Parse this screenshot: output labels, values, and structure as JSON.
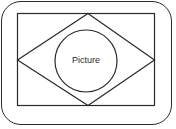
{
  "diagram": {
    "type": "layout-schematic",
    "outer_frame": {
      "shape": "rounded-rectangle",
      "stroke": "#2a2a2a"
    },
    "inner_rect": {
      "x": 17,
      "y": 13,
      "width": 137,
      "height": 92
    },
    "diamond": {
      "points": [
        [
          88,
          13
        ],
        [
          154,
          60
        ],
        [
          88,
          105
        ],
        [
          17,
          60
        ]
      ]
    },
    "circle": {
      "cx": 86,
      "cy": 61,
      "r": 31
    },
    "center_label": "Picture",
    "colors": {
      "stroke": "#2a2a2a",
      "background": "#ffffff"
    }
  }
}
